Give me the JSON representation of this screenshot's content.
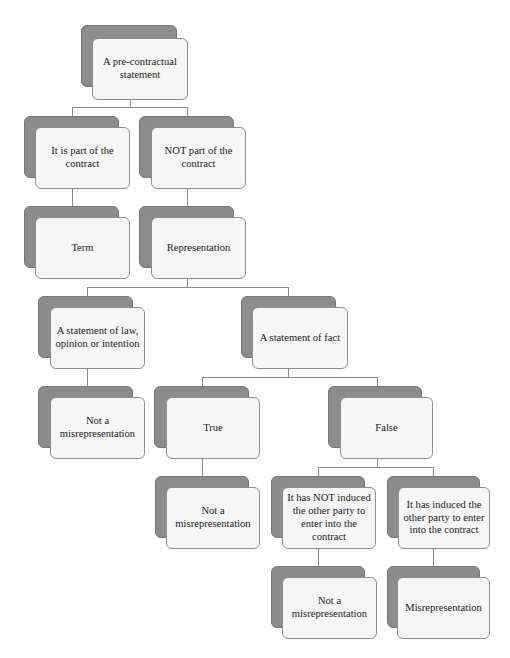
{
  "diagram": {
    "type": "decision-tree",
    "title": "",
    "nodes": [
      {
        "id": "root",
        "label": "A pre-contractual statement",
        "parent": null
      },
      {
        "id": "part",
        "label": "It is part of the contract",
        "parent": "root"
      },
      {
        "id": "notpart",
        "label": "NOT part of the contract",
        "parent": "root"
      },
      {
        "id": "term",
        "label": "Term",
        "parent": "part"
      },
      {
        "id": "rep",
        "label": "Representation",
        "parent": "notpart"
      },
      {
        "id": "law",
        "label": "A statement of law, opinion or intention",
        "parent": "rep"
      },
      {
        "id": "fact",
        "label": "A statement of fact",
        "parent": "rep"
      },
      {
        "id": "notmis1",
        "label": "Not a misrepresentation",
        "parent": "law"
      },
      {
        "id": "true",
        "label": "True",
        "parent": "fact"
      },
      {
        "id": "false",
        "label": "False",
        "parent": "fact"
      },
      {
        "id": "notmis2",
        "label": "Not a misrepresentation",
        "parent": "true"
      },
      {
        "id": "notinduced",
        "label": "It has NOT induced the other party to enter into the contract",
        "parent": "false"
      },
      {
        "id": "induced",
        "label": "It has induced the other party to enter into the contract",
        "parent": "false"
      },
      {
        "id": "notmis3",
        "label": "Not a misrepresentation",
        "parent": "notinduced"
      },
      {
        "id": "mis",
        "label": "Misrepresentation",
        "parent": "induced"
      }
    ],
    "labels": {
      "root": "A pre-contractual statement",
      "part": "It is part of the contract",
      "notpart": "NOT part of the contract",
      "term": "Term",
      "rep": "Representation",
      "law": "A statement of law, opinion or intention",
      "fact": "A statement of fact",
      "notmis1": "Not a misrepresentation",
      "true": "True",
      "false": "False",
      "notmis2": "Not a misrepresentation",
      "notinduced": "It has NOT induced the other party to enter into the contract",
      "induced": "It has induced the other party to enter into the contract",
      "notmis3": "Not a misrepresentation",
      "mis": "Misrepresentation"
    },
    "colors": {
      "shadow": "#8c8c8c",
      "box_fill": "#f6f6f6",
      "box_border": "#8e8e8e",
      "connector": "#8a8a8a",
      "text": "#222222"
    }
  }
}
